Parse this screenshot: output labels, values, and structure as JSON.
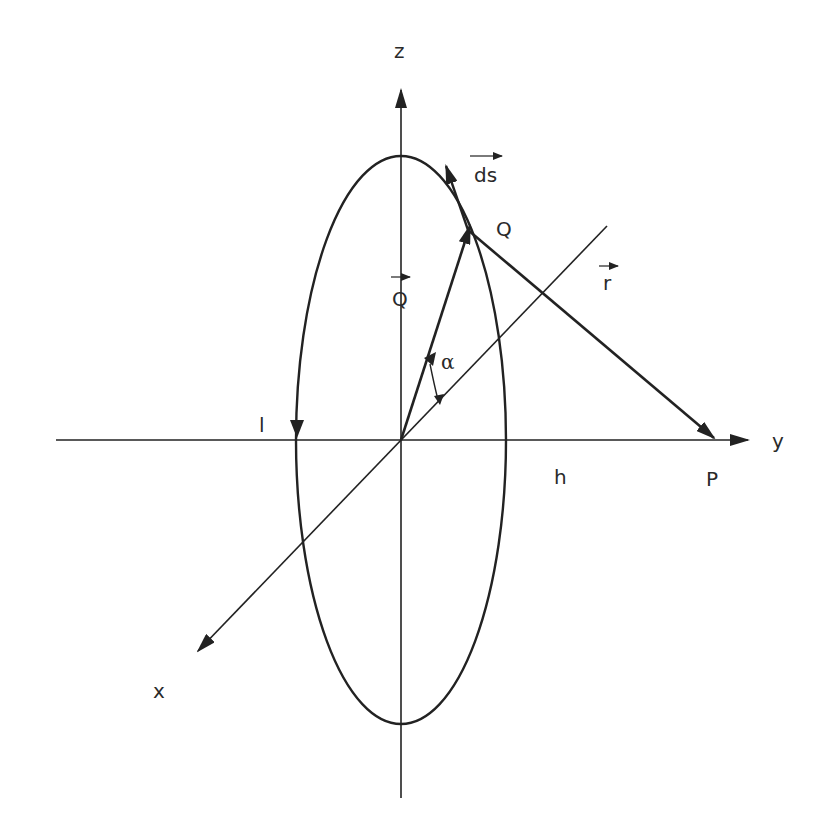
{
  "diagram": {
    "type": "physics-3d-axes-ring",
    "axes": {
      "z_label": "z",
      "y_label": "y",
      "x_label": "x"
    },
    "labels": {
      "ds_vector": "ds",
      "Q_point": "Q",
      "Q_vector": "Q",
      "r_vector": "r",
      "alpha": "α",
      "l_label": "l",
      "h_label": "h",
      "P_point": "P"
    },
    "colors": {
      "stroke": "#222222",
      "text": "#2a2a2a",
      "background": "#ffffff"
    }
  }
}
